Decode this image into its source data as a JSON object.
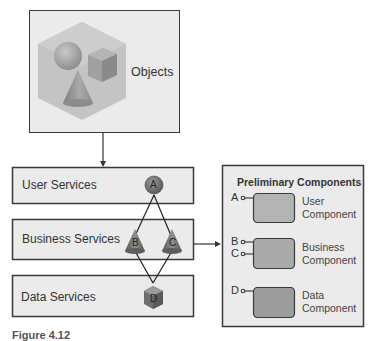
{
  "objects": {
    "label": "Objects"
  },
  "services": [
    {
      "label": "User Services"
    },
    {
      "label": "Business Services"
    },
    {
      "label": "Data Services"
    }
  ],
  "nodes": {
    "A": "A",
    "B": "B",
    "C": "C",
    "D": "D"
  },
  "panel": {
    "title": "Preliminary Components",
    "components": [
      {
        "ports": [
          "A"
        ],
        "line1": "User",
        "line2": "Component"
      },
      {
        "ports": [
          "B",
          "C"
        ],
        "line1": "Business",
        "line2": "Component"
      },
      {
        "ports": [
          "D"
        ],
        "line1": "Data",
        "line2": "Component"
      }
    ]
  },
  "caption": "Figure 4.12"
}
